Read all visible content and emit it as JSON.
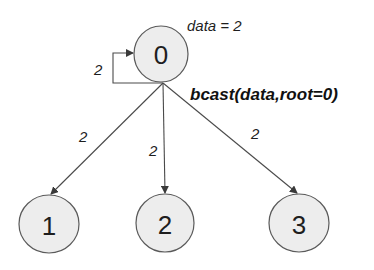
{
  "diagram": {
    "operation_label": "bcast(data,root=0)",
    "root_annotation": "data = 2",
    "nodes": [
      {
        "id": "0",
        "label": "0",
        "role": "root"
      },
      {
        "id": "1",
        "label": "1"
      },
      {
        "id": "2",
        "label": "2"
      },
      {
        "id": "3",
        "label": "3"
      }
    ],
    "edges": [
      {
        "from": "0",
        "to": "0",
        "label": "2"
      },
      {
        "from": "0",
        "to": "1",
        "label": "2"
      },
      {
        "from": "0",
        "to": "2",
        "label": "2"
      },
      {
        "from": "0",
        "to": "3",
        "label": "2"
      }
    ],
    "colors": {
      "node_fill": "#ededed",
      "node_stroke": "#5a5a5a",
      "edge": "#4a4a4a",
      "text": "#1e1e1e"
    }
  }
}
